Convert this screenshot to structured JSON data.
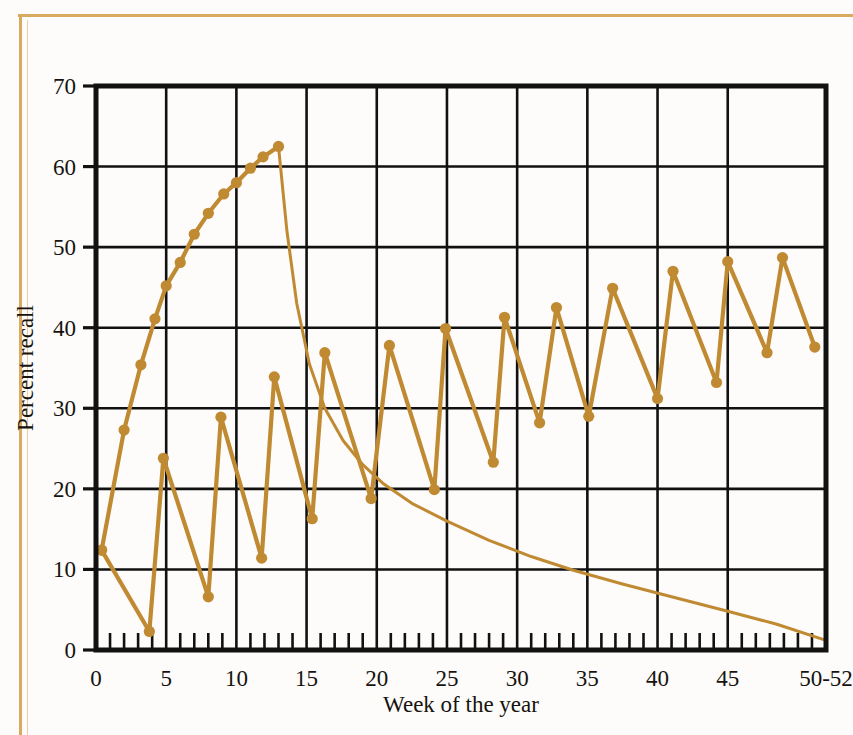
{
  "figure": {
    "background_color": "#fdfcfa",
    "frame_color": "#d9ab61",
    "series_color": "#c08a33",
    "axis_color": "#111111"
  },
  "chart_data": {
    "type": "line",
    "title": "",
    "xlabel": "Week of the year",
    "ylabel": "Percent recall",
    "xlim": [
      0,
      52
    ],
    "ylim": [
      0,
      70
    ],
    "xticks": [
      0,
      5,
      10,
      15,
      20,
      25,
      30,
      35,
      40,
      45,
      52
    ],
    "xticklabels": [
      "0",
      "5",
      "10",
      "15",
      "20",
      "25",
      "30",
      "35",
      "40",
      "45",
      "50-52"
    ],
    "yticks": [
      0,
      10,
      20,
      30,
      40,
      50,
      60,
      70
    ],
    "yticklabels": [
      "0",
      "10",
      "20",
      "30",
      "40",
      "50",
      "60",
      "70"
    ],
    "minor_x_tick_interval": 1,
    "grid": "major-xy",
    "legend": "none",
    "series": [
      {
        "name": "cumulative-learning-curve",
        "marker": "circle",
        "points": [
          {
            "x": 0.4,
            "y": 12.4
          },
          {
            "x": 2.0,
            "y": 27.3
          },
          {
            "x": 3.2,
            "y": 35.4
          },
          {
            "x": 4.2,
            "y": 41.1
          },
          {
            "x": 5.0,
            "y": 45.2
          },
          {
            "x": 6.0,
            "y": 48.1
          },
          {
            "x": 7.0,
            "y": 51.6
          },
          {
            "x": 8.0,
            "y": 54.2
          },
          {
            "x": 9.1,
            "y": 56.6
          },
          {
            "x": 10.0,
            "y": 58.0
          },
          {
            "x": 11.0,
            "y": 59.8
          },
          {
            "x": 11.9,
            "y": 61.2
          },
          {
            "x": 13.0,
            "y": 62.5
          }
        ]
      },
      {
        "name": "forgetting-decay-curve",
        "marker": "none",
        "points": [
          {
            "x": 13.0,
            "y": 62.5
          },
          {
            "x": 13.6,
            "y": 52.0
          },
          {
            "x": 14.3,
            "y": 43.0
          },
          {
            "x": 15.2,
            "y": 35.5
          },
          {
            "x": 16.3,
            "y": 30.0
          },
          {
            "x": 17.6,
            "y": 26.0
          },
          {
            "x": 19.0,
            "y": 23.0
          },
          {
            "x": 20.5,
            "y": 20.6
          },
          {
            "x": 22.5,
            "y": 18.2
          },
          {
            "x": 25.0,
            "y": 16.0
          },
          {
            "x": 28.0,
            "y": 13.6
          },
          {
            "x": 31.0,
            "y": 11.6
          },
          {
            "x": 34.0,
            "y": 9.9
          },
          {
            "x": 37.5,
            "y": 8.2
          },
          {
            "x": 41.0,
            "y": 6.6
          },
          {
            "x": 45.0,
            "y": 4.8
          },
          {
            "x": 48.5,
            "y": 3.2
          },
          {
            "x": 52.0,
            "y": 1.2
          }
        ]
      },
      {
        "name": "weekly-sawtooth-recall",
        "marker": "circle",
        "points": [
          {
            "x": 0.4,
            "y": 12.4
          },
          {
            "x": 3.8,
            "y": 2.3
          },
          {
            "x": 4.8,
            "y": 23.8
          },
          {
            "x": 8.0,
            "y": 6.6
          },
          {
            "x": 8.9,
            "y": 28.9
          },
          {
            "x": 11.8,
            "y": 11.4
          },
          {
            "x": 12.7,
            "y": 33.9
          },
          {
            "x": 15.4,
            "y": 16.3
          },
          {
            "x": 16.3,
            "y": 36.9
          },
          {
            "x": 19.6,
            "y": 18.8
          },
          {
            "x": 20.9,
            "y": 37.8
          },
          {
            "x": 24.1,
            "y": 19.9
          },
          {
            "x": 24.9,
            "y": 39.9
          },
          {
            "x": 28.3,
            "y": 23.3
          },
          {
            "x": 29.1,
            "y": 41.3
          },
          {
            "x": 31.6,
            "y": 28.2
          },
          {
            "x": 32.8,
            "y": 42.5
          },
          {
            "x": 35.1,
            "y": 29.0
          },
          {
            "x": 36.8,
            "y": 44.9
          },
          {
            "x": 40.0,
            "y": 31.2
          },
          {
            "x": 41.1,
            "y": 47.0
          },
          {
            "x": 44.2,
            "y": 33.2
          },
          {
            "x": 45.0,
            "y": 48.2
          },
          {
            "x": 47.8,
            "y": 36.9
          },
          {
            "x": 48.9,
            "y": 48.7
          },
          {
            "x": 51.2,
            "y": 37.6
          }
        ]
      }
    ]
  }
}
